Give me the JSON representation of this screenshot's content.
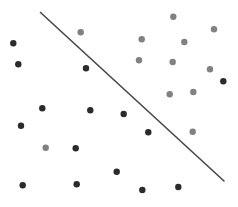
{
  "diagram": {
    "colors": {
      "class_a": "#818181",
      "class_b": "#2b2b2b",
      "boundary": "#474747",
      "background": "#ffffff"
    },
    "point_radius": 3.2,
    "boundary": {
      "x1": 40.5,
      "y1": 12.5,
      "x2": 224,
      "y2": 181
    },
    "points": [
      {
        "x": 80.7,
        "y": 32.3,
        "class": "a"
      },
      {
        "x": 173.3,
        "y": 16.7,
        "class": "a"
      },
      {
        "x": 214,
        "y": 29.3,
        "class": "a"
      },
      {
        "x": 141.7,
        "y": 39.3,
        "class": "a"
      },
      {
        "x": 184.3,
        "y": 42,
        "class": "a"
      },
      {
        "x": 139,
        "y": 60.3,
        "class": "a"
      },
      {
        "x": 172.7,
        "y": 62,
        "class": "a"
      },
      {
        "x": 210,
        "y": 69.3,
        "class": "a"
      },
      {
        "x": 169.7,
        "y": 94.3,
        "class": "a"
      },
      {
        "x": 193.3,
        "y": 92,
        "class": "a"
      },
      {
        "x": 192.7,
        "y": 131.7,
        "class": "a"
      },
      {
        "x": 45.7,
        "y": 147.7,
        "class": "a"
      },
      {
        "x": 13.3,
        "y": 43.3,
        "class": "b"
      },
      {
        "x": 18.3,
        "y": 64.3,
        "class": "b"
      },
      {
        "x": 86,
        "y": 68.3,
        "class": "b"
      },
      {
        "x": 223.3,
        "y": 81.3,
        "class": "b"
      },
      {
        "x": 42.3,
        "y": 108.3,
        "class": "b"
      },
      {
        "x": 90.3,
        "y": 110.3,
        "class": "b"
      },
      {
        "x": 123.7,
        "y": 114,
        "class": "b"
      },
      {
        "x": 21,
        "y": 125.7,
        "class": "b"
      },
      {
        "x": 148.3,
        "y": 132.3,
        "class": "b"
      },
      {
        "x": 75.7,
        "y": 148.3,
        "class": "b"
      },
      {
        "x": 116.7,
        "y": 171.7,
        "class": "b"
      },
      {
        "x": 22.7,
        "y": 185.3,
        "class": "b"
      },
      {
        "x": 76.7,
        "y": 184.3,
        "class": "b"
      },
      {
        "x": 142.3,
        "y": 190,
        "class": "b"
      },
      {
        "x": 178.3,
        "y": 187,
        "class": "b"
      }
    ]
  }
}
